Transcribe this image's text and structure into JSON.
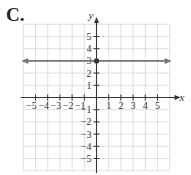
{
  "figure": {
    "label": "C."
  },
  "chart_data": {
    "type": "line",
    "title": "",
    "xlabel": "x",
    "ylabel": "y",
    "xlim": [
      -6,
      6
    ],
    "ylim": [
      -6,
      6
    ],
    "grid": true,
    "x_ticks": [
      "-5",
      "-4",
      "-3",
      "-2",
      "-1",
      "1",
      "2",
      "3",
      "4",
      "5"
    ],
    "y_ticks": [
      "5",
      "4",
      "3",
      "2",
      "1",
      "-1",
      "-2",
      "-3",
      "-4",
      "-5"
    ],
    "series": [
      {
        "name": "y = 3",
        "equation": "y = 3",
        "points": [
          [
            -6,
            3
          ],
          [
            6,
            3
          ]
        ],
        "arrows": "both",
        "color": "#777777"
      }
    ],
    "marked_points": [
      {
        "x": 0,
        "y": 3
      }
    ]
  }
}
